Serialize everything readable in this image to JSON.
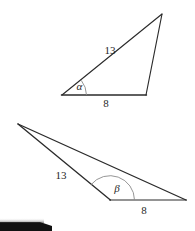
{
  "figure": {
    "background_color": "#ffffff",
    "stroke_color": "#2b2b2b",
    "arc_color": "#8a8a8a",
    "width": 195,
    "height": 231
  },
  "triangle_top": {
    "name": "acute-triangle",
    "side_long_label": "13",
    "side_base_label": "8",
    "angle_label": "α",
    "vertices": {
      "left": [
        62,
        95
      ],
      "apex": [
        162,
        14
      ],
      "base_right": [
        146,
        95
      ]
    },
    "label_positions": {
      "side_long": [
        110,
        51
      ],
      "side_base": [
        106,
        104
      ],
      "angle": [
        80,
        87
      ]
    }
  },
  "triangle_bottom": {
    "name": "obtuse-triangle",
    "side_long_label": "13",
    "side_base_label": "8",
    "angle_label": "β",
    "vertices": {
      "apex_left": [
        18,
        124
      ],
      "angle_vertex": [
        110,
        200
      ],
      "base_right": [
        186,
        200
      ]
    },
    "label_positions": {
      "side_long": [
        61,
        176
      ],
      "side_base": [
        144,
        210
      ],
      "angle": [
        117,
        188
      ]
    }
  },
  "artifact": {
    "name": "page-edge-shadow",
    "description": "dark scan edge at lower-left corner"
  }
}
